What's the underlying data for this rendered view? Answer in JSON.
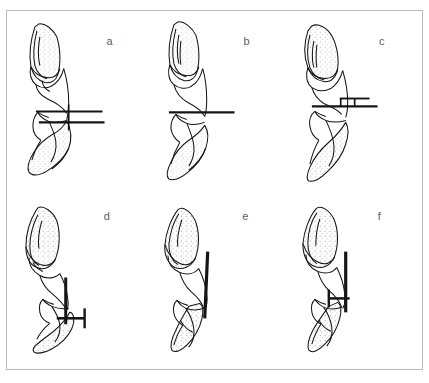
{
  "figure": {
    "background_color": "#ffffff",
    "frame_color": "#b9b9bc",
    "ink_color": "#151515",
    "stipple_color": "#6f6f6f",
    "label_color": "#5d5d60",
    "columns": 3,
    "rows": 2
  },
  "panels": [
    {
      "id": "a",
      "label": "a",
      "description": "Upper and lower incisor in near-vertical alignment; two horizontal reference bars crossed by a short vertical tick at the occlusal contact",
      "overlay": "double-horizontal-bar-with-vertical-tick"
    },
    {
      "id": "b",
      "label": "b",
      "description": "Upper and lower incisor with a single horizontal reference bar at the occlusal contact",
      "overlay": "single-horizontal-bar"
    },
    {
      "id": "c",
      "label": "c",
      "description": "Upper and lower incisor angled apart; a horizontal reference bar with a small stepped bracket above it",
      "overlay": "horizontal-bar-with-step-bracket"
    },
    {
      "id": "d",
      "label": "d",
      "description": "Separated upper and lower incisor; a long vertical reference bar with a short horizontal cross bar forming an H marker",
      "overlay": "vertical-bar-with-h-marker"
    },
    {
      "id": "e",
      "label": "e",
      "description": "Separated upper and lower incisor with a single long vertical reference bar along the labial side",
      "overlay": "vertical-bar"
    },
    {
      "id": "f",
      "label": "f",
      "description": "Separated upper and lower incisor; long vertical reference bar plus an H-shaped marker at the lower crown",
      "overlay": "vertical-bar-with-h-marker"
    }
  ]
}
